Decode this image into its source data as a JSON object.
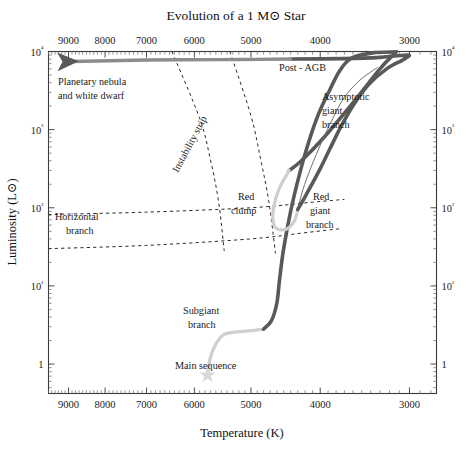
{
  "chart_data": {
    "type": "line",
    "title": "Evolution of a 1 M⊙ Star",
    "xlabel": "Temperature (K)",
    "ylabel": "Luminosity (L⊙)",
    "x_axis": {
      "scale": "log",
      "reversed": true,
      "min": 9600,
      "max": 2750,
      "tick_labels": [
        "9000",
        "8000",
        "7000",
        "6000",
        "5000",
        "4000",
        "3000"
      ],
      "tick_values": [
        9000,
        8000,
        7000,
        6000,
        5000,
        4000,
        3000
      ],
      "position": "both-top-and-bottom"
    },
    "y_axis": {
      "scale": "log",
      "min": 0.42,
      "max": 10000,
      "tick_labels": [
        "10⁴",
        "10³",
        "10²",
        "10¹",
        "1"
      ],
      "tick_values": [
        10000,
        1000,
        100,
        10,
        1
      ],
      "position": "both-left-and-right"
    },
    "grid": false,
    "legend": "none",
    "series": [
      {
        "name": "main-sequence-to-subgiant",
        "shade": "light",
        "points": [
          [
            5750,
            0.75
          ],
          [
            5700,
            1.2
          ],
          [
            5600,
            1.8
          ],
          [
            5450,
            2.4
          ],
          [
            5200,
            2.6
          ],
          [
            4950,
            2.7
          ],
          [
            4800,
            2.8
          ]
        ]
      },
      {
        "name": "red-giant-branch",
        "shade": "dark",
        "points": [
          [
            4800,
            2.8
          ],
          [
            4680,
            3.6
          ],
          [
            4600,
            6.0
          ],
          [
            4560,
            12
          ],
          [
            4500,
            30
          ],
          [
            4400,
            90
          ],
          [
            4280,
            260
          ],
          [
            4150,
            700
          ],
          [
            4020,
            1600
          ],
          [
            3880,
            3200
          ],
          [
            3760,
            5600
          ],
          [
            3620,
            8200
          ],
          [
            3380,
            9600
          ],
          [
            3130,
            9900
          ]
        ]
      },
      {
        "name": "helium-flash-descent",
        "shade": "dark",
        "points": [
          [
            3130,
            9900
          ],
          [
            3300,
            6000
          ],
          [
            3600,
            2200
          ],
          [
            3950,
            800
          ],
          [
            4250,
            400
          ],
          [
            4420,
            300
          ]
        ]
      },
      {
        "name": "red-clump-loop",
        "shade": "light",
        "points": [
          [
            4420,
            300
          ],
          [
            4560,
            180
          ],
          [
            4640,
            110
          ],
          [
            4660,
            72
          ],
          [
            4620,
            56
          ],
          [
            4520,
            52
          ],
          [
            4420,
            56
          ],
          [
            4340,
            70
          ],
          [
            4300,
            95
          ]
        ]
      },
      {
        "name": "early-agb",
        "shade": "thin",
        "points": [
          [
            4300,
            95
          ],
          [
            4230,
            170
          ],
          [
            4120,
            330
          ],
          [
            3980,
            700
          ],
          [
            3840,
            1400
          ],
          [
            3700,
            2600
          ],
          [
            3520,
            4300
          ],
          [
            3330,
            6200
          ]
        ]
      },
      {
        "name": "asymptotic-giant-branch",
        "shade": "dark",
        "points": [
          [
            4300,
            95
          ],
          [
            4180,
            150
          ],
          [
            4020,
            290
          ],
          [
            3880,
            560
          ],
          [
            3740,
            1100
          ],
          [
            3590,
            2100
          ],
          [
            3420,
            3800
          ],
          [
            3230,
            6000
          ],
          [
            3080,
            7600
          ]
        ]
      },
      {
        "name": "agb-tip-to-post-agb",
        "shade": "dark",
        "points": [
          [
            3080,
            7600
          ],
          [
            3010,
            8700
          ],
          [
            3010,
            9000
          ],
          [
            3090,
            8900
          ],
          [
            3300,
            8400
          ],
          [
            3700,
            8100
          ],
          [
            4400,
            8000
          ]
        ]
      },
      {
        "name": "post-agb-horizontal",
        "shade": "mid",
        "points": [
          [
            4400,
            8000
          ],
          [
            5200,
            7900
          ],
          [
            6200,
            7850
          ],
          [
            7000,
            7800
          ]
        ]
      },
      {
        "name": "planetary-nebula-arrow",
        "shade": "dark-arrow",
        "points": [
          [
            7000,
            7800
          ],
          [
            8900,
            7450
          ]
        ]
      }
    ],
    "bands": [
      {
        "name": "instability-strip-blue-edge",
        "style": "dashed",
        "points": [
          [
            6450,
            10000
          ],
          [
            5900,
            1400
          ],
          [
            5700,
            420
          ],
          [
            5550,
            120
          ],
          [
            5450,
            28
          ]
        ]
      },
      {
        "name": "instability-strip-red-edge",
        "style": "dashed",
        "points": [
          [
            5350,
            10000
          ],
          [
            5000,
            1500
          ],
          [
            4850,
            430
          ],
          [
            4720,
            120
          ],
          [
            4620,
            26
          ]
        ]
      },
      {
        "name": "horizontal-branch-upper",
        "style": "dashed",
        "points": [
          [
            9600,
            82
          ],
          [
            7000,
            88
          ],
          [
            5000,
            100
          ],
          [
            4100,
            118
          ],
          [
            3700,
            128
          ]
        ]
      },
      {
        "name": "horizontal-branch-lower",
        "style": "dashed",
        "points": [
          [
            9600,
            30
          ],
          [
            7000,
            33
          ],
          [
            5000,
            40
          ],
          [
            4200,
            48
          ],
          [
            3750,
            54
          ]
        ]
      }
    ],
    "markers": [
      {
        "name": "main-sequence-star",
        "glyph": "star",
        "x": 5750,
        "y": 0.72
      }
    ],
    "annotations": [
      {
        "name": "planetary-nebula-and-white-dwarf",
        "text": "Planetary nebula",
        "x_px": 58,
        "y_px": 85,
        "rotation": 0
      },
      {
        "name": "planetary-nebula-and-white-dwarf-line2",
        "text": "and white dwarf",
        "x_px": 58,
        "y_px": 99,
        "rotation": 0
      },
      {
        "name": "post-agb",
        "text": "Post - AGB",
        "x_px": 279,
        "y_px": 71,
        "rotation": 0
      },
      {
        "name": "asymptotic-giant-branch-line1",
        "text": "Asymptotic",
        "x_px": 322,
        "y_px": 100,
        "rotation": 0
      },
      {
        "name": "asymptotic-giant-branch-line2",
        "text": "giant",
        "x_px": 322,
        "y_px": 114,
        "rotation": 0
      },
      {
        "name": "asymptotic-giant-branch-line3",
        "text": "branch",
        "x_px": 322,
        "y_px": 128,
        "rotation": 0
      },
      {
        "name": "instability-strip",
        "text": "Instability strip",
        "x_px": 178,
        "y_px": 173,
        "rotation": -62
      },
      {
        "name": "horizontal-branch-line1",
        "text": "Horizontal",
        "x_px": 55,
        "y_px": 220,
        "rotation": 0
      },
      {
        "name": "horizontal-branch-line2",
        "text": "branch",
        "x_px": 66,
        "y_px": 234,
        "rotation": 0
      },
      {
        "name": "red-clump-line1",
        "text": "Red",
        "x_px": 238,
        "y_px": 200,
        "rotation": 0
      },
      {
        "name": "red-clump-line2",
        "text": "clump",
        "x_px": 231,
        "y_px": 214,
        "rotation": 0
      },
      {
        "name": "red-giant-branch-line1",
        "text": "Red",
        "x_px": 313,
        "y_px": 200,
        "rotation": 0
      },
      {
        "name": "red-giant-branch-line2",
        "text": "giant",
        "x_px": 310,
        "y_px": 214,
        "rotation": 0
      },
      {
        "name": "red-giant-branch-line3",
        "text": "branch",
        "x_px": 306,
        "y_px": 228,
        "rotation": 0
      },
      {
        "name": "subgiant-branch-line1",
        "text": "Subgiant",
        "x_px": 183,
        "y_px": 314,
        "rotation": 0
      },
      {
        "name": "subgiant-branch-line2",
        "text": "branch",
        "x_px": 188,
        "y_px": 328,
        "rotation": 0
      },
      {
        "name": "main-sequence",
        "text": "Main sequence",
        "x_px": 175,
        "y_px": 369,
        "rotation": 0
      }
    ],
    "colors": {
      "track_dark": "#595959",
      "track_mid": "#8d8d8d",
      "track_light": "#cfcfcf",
      "axis": "#3a3a3a",
      "text": "#1a1a1a",
      "background": "#ffffff"
    }
  }
}
